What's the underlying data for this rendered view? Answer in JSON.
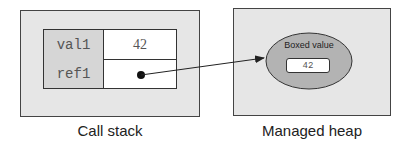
{
  "call_stack": {
    "caption": "Call stack",
    "rows": [
      {
        "name": "val1",
        "value": "42"
      },
      {
        "name": "ref1",
        "value": ""
      }
    ]
  },
  "managed_heap": {
    "caption": "Managed heap",
    "boxed": {
      "label": "Boxed value",
      "value": "42"
    }
  },
  "colors": {
    "panel_bg": "#e6e6e6",
    "name_cell_bg": "#d6d6d6",
    "ellipse_fill": "#b3b3b3",
    "stroke": "#333333"
  }
}
